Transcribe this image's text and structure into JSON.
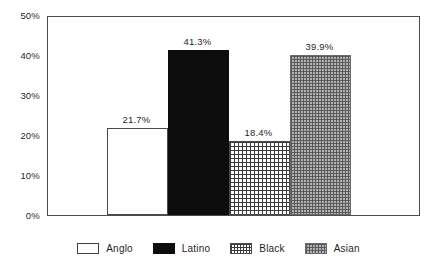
{
  "chart_data": {
    "type": "bar",
    "title": "",
    "subtitle": "",
    "xlabel": "",
    "ylabel": "",
    "categories": [
      "Anglo",
      "Latino",
      "Black",
      "Asian"
    ],
    "values": [
      21.7,
      41.3,
      18.4,
      39.9
    ],
    "data_labels": [
      "21.7%",
      "41.3%",
      "18.4%",
      "39.9%"
    ],
    "ylim": [
      0,
      50
    ],
    "ytick_values": [
      0,
      10,
      20,
      30,
      40,
      50
    ],
    "ytick_labels": [
      "0%",
      "10%",
      "20%",
      "30%",
      "40%",
      "50%"
    ],
    "grid": false,
    "legend_position": "bottom",
    "series": [
      {
        "name": "Anglo",
        "value": 21.7,
        "label": "21.7%",
        "fill": "white",
        "color": "#ffffff"
      },
      {
        "name": "Latino",
        "value": 41.3,
        "label": "41.3%",
        "fill": "solid-black",
        "color": "#0d0d0d"
      },
      {
        "name": "Black",
        "value": 18.4,
        "label": "18.4%",
        "fill": "grid-hatch",
        "color": "#3b3b3b"
      },
      {
        "name": "Asian",
        "value": 39.9,
        "label": "39.9%",
        "fill": "stipple-gray",
        "color": "#8c8c8c"
      }
    ]
  },
  "axis": {
    "frame_color": "#4c4c4c",
    "tick_color": "#4c4c4c"
  },
  "legend": {
    "items": [
      {
        "label": "Anglo"
      },
      {
        "label": "Latino"
      },
      {
        "label": "Black"
      },
      {
        "label": "Asian"
      }
    ]
  }
}
